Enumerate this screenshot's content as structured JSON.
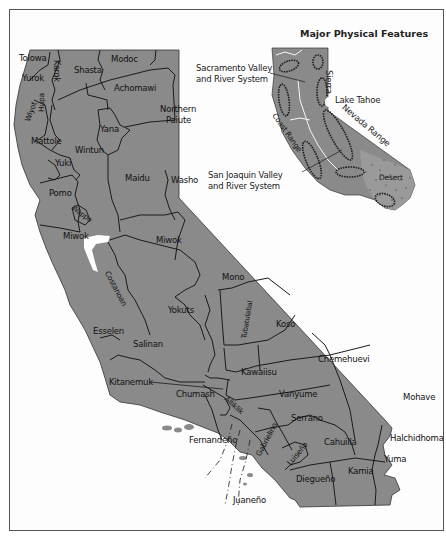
{
  "inset": {
    "title": "Major Physical Features",
    "features": [
      {
        "id": "sacramento",
        "label_line1": "Sacramento Valley",
        "label_line2": "and River System"
      },
      {
        "id": "sierra_a",
        "label": "Sierra"
      },
      {
        "id": "lake_tahoe",
        "label": "Lake Tahoe"
      },
      {
        "id": "sierra_b",
        "label": "Nevada Range"
      },
      {
        "id": "coast_range",
        "label": "Coast Range"
      },
      {
        "id": "sanjoaquin",
        "label_line1": "San Joaquin Valley",
        "label_line2": "and River System"
      },
      {
        "id": "desert",
        "label": "Desert"
      }
    ]
  },
  "tribes": {
    "tolowa": "Tolowa",
    "yurok": "Yurok",
    "karok": "Karok",
    "shasta": "Shasta",
    "modoc": "Modoc",
    "achomawi": "Achomawi",
    "wiyot": "Wiyot",
    "hupa": "Hupa",
    "northern_paiute_1": "Northern",
    "northern_paiute_2": "Paiute",
    "yana": "Yana",
    "mattole": "Mattole",
    "wintun": "Wintun",
    "yuki": "Yuki",
    "maidu": "Maidu",
    "washo": "Washo",
    "pomo": "Pomo",
    "wappo": "Wappo",
    "miwok_coast": "Miwok",
    "miwok": "Miwok",
    "costanoan": "Costanoan",
    "mono": "Mono",
    "yokuts": "Yokuts",
    "esselen": "Esselen",
    "salinan": "Salinan",
    "tubatulabal": "Tubatulabal",
    "koso": "Koso",
    "kawaiisu": "Kawaiisu",
    "chemehuevi": "Chemehuevi",
    "kitanemuk": "Kitanemuk",
    "chumash": "Chumash",
    "alliklik": "Alliklik",
    "vanyume": "Vanyume",
    "mohave": "Mohave",
    "serrano": "Serrano",
    "fernandeno": "Fernandeño",
    "gabrielino": "Gabrielino",
    "luiseno": "Luiseño",
    "cahuilla": "Cahuilla",
    "halchidhoma": "Halchidhoma",
    "yuma": "Yuma",
    "kamia": "Kamia",
    "diegueno": "Diegueño",
    "juaneno": "Juaneño"
  },
  "colors": {
    "land": "#8a8a8a",
    "border": "#1a1a1a",
    "water": "#ffffff",
    "background": "#fdfdfd"
  }
}
